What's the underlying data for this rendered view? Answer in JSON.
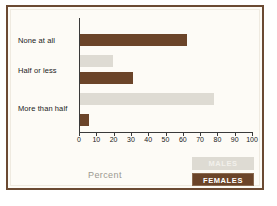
{
  "chart_data": {
    "type": "bar",
    "orientation": "horizontal",
    "title": "",
    "xlabel": "Percent",
    "ylabel": "",
    "xlim": [
      0,
      100
    ],
    "xticks": [
      0,
      10,
      20,
      30,
      40,
      50,
      60,
      70,
      80,
      90,
      100
    ],
    "grid": false,
    "legend_position": "bottom-right",
    "categories": [
      "None at all",
      "Half or less",
      "More than half"
    ],
    "series": [
      {
        "name": "MALES",
        "color": "#dedbd3",
        "values": [
          0,
          19,
          78
        ]
      },
      {
        "name": "FEMALES",
        "color": "#6b4429",
        "values": [
          62,
          31,
          5
        ]
      }
    ]
  },
  "axis": {
    "title": "Percent",
    "tick_labels": [
      "0",
      "10",
      "20",
      "30",
      "40",
      "50",
      "60",
      "70",
      "80",
      "90",
      "100"
    ]
  },
  "categories": {
    "c0": "None at all",
    "c1": "Half or less",
    "c2": "More than half"
  },
  "legend": {
    "males": "MALES",
    "females": "FEMALES"
  },
  "colors": {
    "males": "#dedbd3",
    "females": "#6b4429",
    "frame": "#6b4a33",
    "background": "#fdfbf6",
    "axis": "#3a3a3a",
    "axis_title": "#9b9890"
  }
}
